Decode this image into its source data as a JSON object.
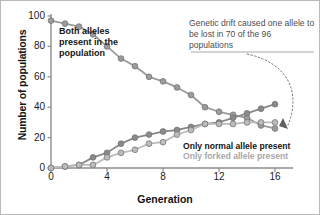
{
  "figure": {
    "background": "#ffffff",
    "border_color": "#b9b9b9"
  },
  "annotations": {
    "both_alleles": "Both alleles present in the population",
    "drift": "Genetic drift caused one allele to be lost in 70 of the 96 populations"
  },
  "legend": {
    "normal": "Only normal allele present",
    "forked": "Only forked allele present"
  },
  "colors": {
    "both_alleles": "#9b9b9b",
    "normal_allele": "#8a8a8a",
    "forked_allele": "#bcbcbc",
    "marker_edge": "#6e6e6e",
    "axis": "#8c8c8c",
    "text_dark": "#141414",
    "text_gray": "#4d4d4d"
  },
  "chart_data": {
    "type": "line",
    "title": "",
    "xlabel": "Generation",
    "ylabel": "Number of populations",
    "xlim": [
      0,
      17
    ],
    "ylim": [
      0,
      100
    ],
    "xticks": [
      0,
      4,
      8,
      12,
      16
    ],
    "yticks": [
      0,
      20,
      40,
      60,
      80,
      100
    ],
    "grid": false,
    "legend_position": "lower-right",
    "total_populations": 96,
    "series": [
      {
        "name": "Both alleles present in the population",
        "color": "#9b9b9b",
        "x": [
          0,
          1,
          2,
          3,
          4,
          5,
          6,
          7,
          8,
          9,
          10,
          11,
          12,
          13,
          14,
          15,
          16
        ],
        "values": [
          97,
          95,
          93,
          88,
          80,
          72,
          67,
          60,
          57,
          53,
          48,
          40,
          37,
          35,
          33,
          28,
          26
        ]
      },
      {
        "name": "Only normal allele present",
        "color": "#8a8a8a",
        "x": [
          0,
          1,
          2,
          3,
          4,
          5,
          6,
          7,
          8,
          9,
          10,
          11,
          12,
          13,
          14,
          15,
          16
        ],
        "values": [
          0,
          1,
          2,
          7,
          10,
          16,
          20,
          22,
          24,
          25,
          27,
          29,
          30,
          33,
          36,
          39,
          42
        ]
      },
      {
        "name": "Only forked allele present",
        "color": "#bcbcbc",
        "x": [
          0,
          1,
          2,
          3,
          4,
          5,
          6,
          7,
          8,
          9,
          10,
          11,
          12,
          13,
          14,
          15,
          16
        ],
        "values": [
          0,
          1,
          2,
          2,
          7,
          10,
          12,
          16,
          17,
          22,
          25,
          29,
          29,
          29,
          30,
          30,
          30
        ]
      }
    ]
  }
}
